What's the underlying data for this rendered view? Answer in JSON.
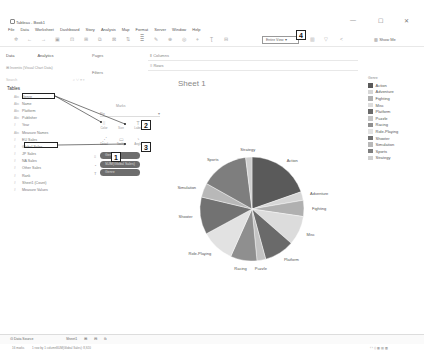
{
  "window": {
    "title": "Tableau - Book1",
    "controls": {
      "minimize": "—",
      "maximize": "☐",
      "close": "✕"
    }
  },
  "menu": [
    "File",
    "Data",
    "Worksheet",
    "Dashboard",
    "Story",
    "Analysis",
    "Map",
    "Format",
    "Server",
    "Window",
    "Help"
  ],
  "toolbar": {
    "icons": [
      "tableau-logo-icon",
      "undo-icon",
      "redo-icon",
      "save-icon",
      "new-datasource-icon",
      "new-worksheet-icon",
      "duplicate-icon",
      "clear-icon",
      "swap-icon",
      "sort-asc-icon",
      "sort-desc-icon",
      "highlight-icon",
      "group-icon",
      "label-icon",
      "fix-axes-icon"
    ],
    "view_select": "Entire View",
    "show_me": "Show Me"
  },
  "left_panel": {
    "tab_data": "Data",
    "tab_analytics": "Analytics",
    "search_placeholder": "Search",
    "datasource": "Inventis (Visual Chart Data)",
    "tables_heading": "Tables",
    "fields": [
      {
        "type": "Abc",
        "name": "Genre"
      },
      {
        "type": "Abc",
        "name": "Name"
      },
      {
        "type": "Abc",
        "name": "Platform"
      },
      {
        "type": "Abc",
        "name": "Publisher"
      },
      {
        "type": "#",
        "name": "Year"
      },
      {
        "type": "Abc",
        "name": "Measure Names"
      },
      {
        "type": "#",
        "name": "EU Sales"
      },
      {
        "type": "#",
        "name": "Global Sales"
      },
      {
        "type": "#",
        "name": "JP Sales"
      },
      {
        "type": "#",
        "name": "NA Sales"
      },
      {
        "type": "#",
        "name": "Other Sales"
      },
      {
        "type": "#",
        "name": "Rank"
      },
      {
        "type": "#",
        "name": "Sheet1 (Count)"
      },
      {
        "type": "#",
        "name": "Measure Values"
      }
    ]
  },
  "cards": {
    "pages": "Pages",
    "filters": "Filters",
    "marks": "Marks",
    "marks_type": "Pie",
    "marks_buttons": [
      {
        "label": "Color",
        "glyph": "⁞⁞"
      },
      {
        "label": "Size",
        "glyph": "◌"
      },
      {
        "label": "Label",
        "glyph": "T"
      },
      {
        "label": "Detail",
        "glyph": "⋰"
      },
      {
        "label": "Tooltip",
        "glyph": "▭"
      },
      {
        "label": "Angle",
        "glyph": "◔"
      }
    ],
    "pills": [
      {
        "icon": "⁞⁞",
        "label": "Genre"
      },
      {
        "icon": "◔",
        "label": "SUM(Global Sales)"
      },
      {
        "icon": "T",
        "label": "Genre"
      }
    ]
  },
  "shelves": {
    "columns": "Columns",
    "rows": "Rows"
  },
  "sheet": {
    "title": "Sheet 1"
  },
  "legend": {
    "title": "Genre"
  },
  "callouts": [
    "1",
    "2",
    "3",
    "4"
  ],
  "bottom": {
    "datasource_tab": "Data Source",
    "sheet_tab": "Sheet1",
    "status": [
      "16 marks",
      "1 row by 1 column",
      "SUM(Global Sales): 8,920"
    ]
  },
  "chart_data": {
    "type": "pie",
    "title": "Sheet 1",
    "legend_title": "Genre",
    "legend_position": "right",
    "categories": [
      "Action",
      "Adventure",
      "Fighting",
      "Misc",
      "Platform",
      "Puzzle",
      "Racing",
      "Role-Playing",
      "Shooter",
      "Simulation",
      "Sports",
      "Strategy"
    ],
    "values": [
      1751,
      239,
      448,
      810,
      831,
      245,
      733,
      927,
      1037,
      392,
      1331,
      175
    ],
    "colors": [
      "#5a5a5a",
      "#d6d6d6",
      "#b0b0b0",
      "#dcdcdc",
      "#6a6a6a",
      "#c4c4c4",
      "#8f8f8f",
      "#e2e2e2",
      "#727272",
      "#b8b8b8",
      "#7e7e7e",
      "#cfcfcf"
    ]
  }
}
